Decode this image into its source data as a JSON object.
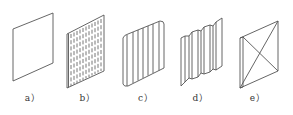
{
  "figure": {
    "panels": [
      {
        "id": "a",
        "label": "a）",
        "type": "flat-panel"
      },
      {
        "id": "b",
        "label": "b）",
        "type": "perforated-panel"
      },
      {
        "id": "c",
        "label": "c）",
        "type": "corrugated-panel"
      },
      {
        "id": "d",
        "label": "d）",
        "type": "trapezoidal-corrugated-panel"
      },
      {
        "id": "e",
        "label": "e）",
        "type": "cross-braced-panel"
      }
    ],
    "colors": {
      "stroke": "#555555",
      "background": "#ffffff"
    }
  }
}
